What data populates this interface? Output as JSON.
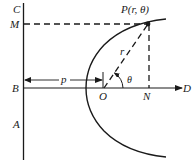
{
  "diagram": {
    "labels": {
      "C": "C",
      "M": "M",
      "B": "B",
      "A": "A",
      "O": "O",
      "N": "N",
      "D": "D",
      "p": "p",
      "r": "r",
      "theta": "θ",
      "P": "P(r, θ)"
    },
    "colors": {
      "ink": "#1a1a1a",
      "background": "#ffffff"
    }
  }
}
